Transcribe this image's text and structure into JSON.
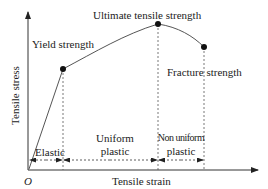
{
  "diagram": {
    "axes": {
      "y_label": "Tensile stress",
      "x_label": "Tensile strain",
      "origin_label": "O"
    },
    "points": [
      {
        "name": "yield",
        "label": "Yield strength",
        "x": 63,
        "y": 69
      },
      {
        "name": "ultimate",
        "label": "Ultimate tensile strength",
        "x": 158,
        "y": 24
      },
      {
        "name": "fracture",
        "label": "Fracture strength",
        "x": 204,
        "y": 47
      }
    ],
    "regions": [
      {
        "name": "elastic",
        "label_line1": "Elastic",
        "label_line2": ""
      },
      {
        "name": "uniform-plastic",
        "label_line1": "Uniform",
        "label_line2": "plastic"
      },
      {
        "name": "non-uniform-plastic",
        "label_line1": "Non uniform",
        "label_line2": "plastic"
      }
    ],
    "colors": {
      "line": "#555555",
      "point": "#111111",
      "text": "#222222"
    }
  }
}
